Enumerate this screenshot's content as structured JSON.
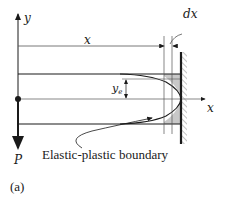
{
  "figure": {
    "panel_label": "(a)",
    "axes": {
      "y_label": "y",
      "x_label": "x"
    },
    "dimensions": {
      "length_label": "x",
      "increment_label": "dx",
      "half_depth_label_main": "y",
      "half_depth_label_sub": "e"
    },
    "load": {
      "label": "P"
    },
    "annotation": {
      "text": "Elastic-plastic boundary"
    },
    "colors": {
      "line": "#1a1a1a",
      "shade": "#c8c8c8",
      "hatch": "#888888"
    }
  }
}
